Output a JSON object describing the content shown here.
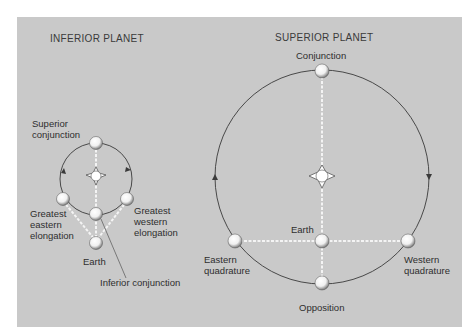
{
  "diagram": {
    "inferior": {
      "title": "INFERIOR PLANET",
      "labels": {
        "superior_conjunction_1": "Superior",
        "superior_conjunction_2": "conjunction",
        "greatest_eastern_1": "Greatest",
        "greatest_eastern_2": "eastern",
        "greatest_eastern_3": "elongation",
        "greatest_western_1": "Greatest",
        "greatest_western_2": "western",
        "greatest_western_3": "elongation",
        "earth": "Earth",
        "inferior_conjunction": "Inferior conjunction"
      }
    },
    "superior": {
      "title": "SUPERIOR PLANET",
      "labels": {
        "conjunction": "Conjunction",
        "earth": "Earth",
        "eastern_quadrature_1": "Eastern",
        "eastern_quadrature_2": "quadrature",
        "western_quadrature_1": "Western",
        "western_quadrature_2": "quadrature",
        "opposition": "Opposition"
      }
    },
    "colors": {
      "background": "#c9c9c9",
      "orbit": "#3a3a3a",
      "sightline": "#f4f4f4",
      "text": "#2e2e2e"
    }
  }
}
